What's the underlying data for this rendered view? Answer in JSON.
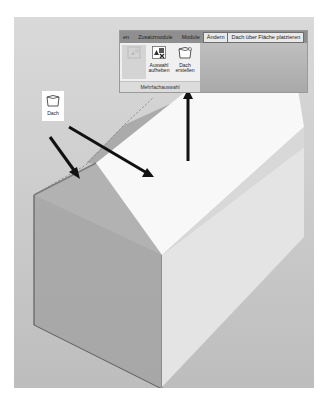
{
  "ribbon": {
    "tabs": [
      {
        "label": "en"
      },
      {
        "label": "Zusatzmodule"
      },
      {
        "label": "Module"
      },
      {
        "label": "Ändern"
      },
      {
        "label": "Dach über Fläche platzieren"
      }
    ],
    "active_tab_index": 3,
    "buttons": [
      {
        "label_line1": "",
        "label_line2": "",
        "icon": "multi-select-icon",
        "disabled": true
      },
      {
        "label_line1": "Auswahl",
        "label_line2": "aufheben",
        "icon": "deselect-icon",
        "disabled": false
      },
      {
        "label_line1": "Dach",
        "label_line2": "erstellen",
        "icon": "roof-create-icon",
        "disabled": false
      }
    ],
    "group_label": "Mehrfachauswahl"
  },
  "callout": {
    "label": "Dach",
    "icon": "roof-icon"
  },
  "colors": {
    "viewport_bg": "#cfcfcf",
    "roof_face": "#f7f7f7",
    "gable_face": "#9c9c9c",
    "side_wall": "#e6e6e6",
    "arrow": "#111111"
  }
}
